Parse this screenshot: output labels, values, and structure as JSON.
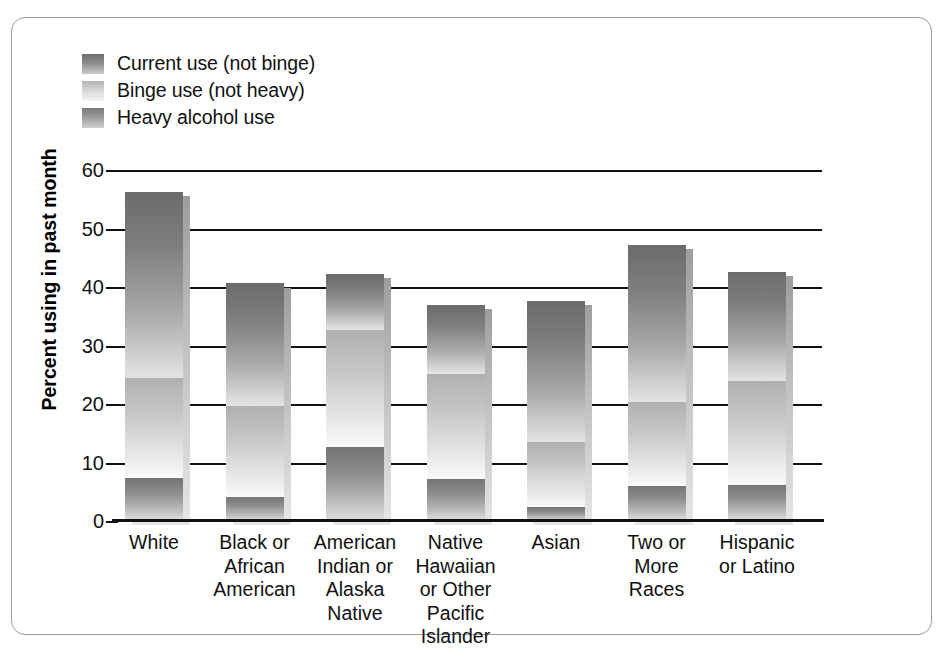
{
  "chart_data": {
    "type": "bar",
    "subtype": "stacked-bar",
    "title": "",
    "xlabel": "",
    "ylabel": "Percent using in past month",
    "ylim": [
      0,
      60
    ],
    "yticks": [
      0,
      10,
      20,
      30,
      40,
      50,
      60
    ],
    "grid": true,
    "legend_position": "top-left",
    "categories": [
      "White",
      "Black or African American",
      "American Indian or Alaska Native",
      "Native Hawaiian or Other Pacific Islander",
      "Asian",
      "Two or More Races",
      "Hispanic or Latino"
    ],
    "category_lines": [
      [
        "White"
      ],
      [
        "Black or",
        "African",
        "American"
      ],
      [
        "American",
        "Indian or",
        "Alaska",
        "Native"
      ],
      [
        "Native",
        "Hawaiian",
        "or Other",
        "Pacific",
        "Islander"
      ],
      [
        "Asian"
      ],
      [
        "Two or",
        "More",
        "Races"
      ],
      [
        "Hispanic",
        "or Latino"
      ]
    ],
    "series": [
      {
        "name": "Heavy alcohol use",
        "key": "heavy",
        "color": "#7b7b7b",
        "values": [
          7.3,
          4.1,
          12.7,
          7.1,
          2.4,
          6.0,
          6.1
        ]
      },
      {
        "name": "Binge use (not heavy)",
        "key": "binge",
        "color": "#d6d6d6",
        "values": [
          17.2,
          15.6,
          20.0,
          18.0,
          11.1,
          14.3,
          17.8
        ]
      },
      {
        "name": "Current use (not binge)",
        "key": "current",
        "color": "#6e6e6e",
        "values": [
          31.8,
          20.9,
          9.6,
          11.9,
          24.1,
          26.8,
          18.7
        ]
      }
    ],
    "cumulative_tops": {
      "heavy": [
        7.3,
        4.1,
        12.7,
        7.1,
        2.4,
        6.0,
        6.1
      ],
      "binge": [
        24.5,
        19.7,
        32.7,
        25.1,
        13.5,
        20.3,
        23.9
      ],
      "current": [
        56.3,
        40.6,
        42.3,
        37.0,
        37.6,
        47.1,
        42.6
      ]
    }
  },
  "legend": {
    "items": [
      {
        "label": "Current use (not binge)",
        "swatch": "current-use-swatch"
      },
      {
        "label": "Binge use (not heavy)",
        "swatch": "binge-use-swatch"
      },
      {
        "label": "Heavy alcohol use",
        "swatch": "heavy-use-swatch"
      }
    ]
  },
  "axes": {
    "y_axis_title": "Percent using in past month",
    "y_tick_labels": [
      "60",
      "50",
      "40",
      "30",
      "20",
      "10",
      "0"
    ]
  },
  "colors": {
    "frame_border": "#9a9a9a",
    "axis": "#111111",
    "background": "#ffffff",
    "current_use": "#6e6e6e",
    "binge_use": "#d6d6d6",
    "heavy_use": "#7b7b7b"
  }
}
